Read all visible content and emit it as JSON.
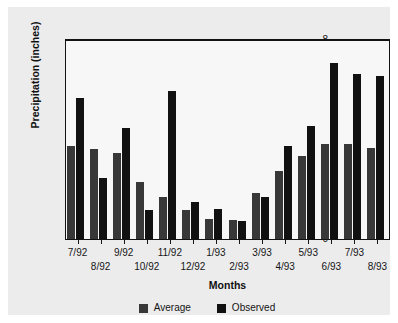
{
  "chart_data": {
    "type": "bar",
    "title": "",
    "xlabel": "Months",
    "ylabel": "Precipitation (inches)",
    "ylim": [
      0,
      8
    ],
    "yticks": [
      0,
      1,
      2,
      3,
      4,
      5,
      6,
      7,
      8
    ],
    "ytick_labels": [
      "0",
      "1",
      "2",
      "3",
      "4",
      "5",
      "6",
      "7",
      "8"
    ],
    "grid": false,
    "legend_position": "bottom-center",
    "categories": [
      "7/92",
      "8/92",
      "9/92",
      "10/92",
      "11/92",
      "12/92",
      "1/93",
      "2/93",
      "3/93",
      "4/93",
      "5/93",
      "6/93",
      "7/93",
      "8/93"
    ],
    "series": [
      {
        "name": "Average",
        "color": "#383838",
        "values": [
          3.75,
          3.6,
          3.45,
          2.3,
          1.68,
          1.18,
          0.8,
          0.78,
          1.85,
          2.72,
          3.35,
          3.83,
          3.8,
          3.65
        ]
      },
      {
        "name": "Observed",
        "color": "#111111",
        "values": [
          5.65,
          2.45,
          4.45,
          1.15,
          5.97,
          1.48,
          1.22,
          0.72,
          1.68,
          3.75,
          4.55,
          7.08,
          6.65,
          6.55
        ]
      }
    ]
  },
  "legend": {
    "items": [
      {
        "label": "Average",
        "color": "#383838"
      },
      {
        "label": "Observed",
        "color": "#111111"
      }
    ]
  },
  "axes": {
    "y_title": "Precipitation (inches)",
    "x_title": "Months"
  }
}
